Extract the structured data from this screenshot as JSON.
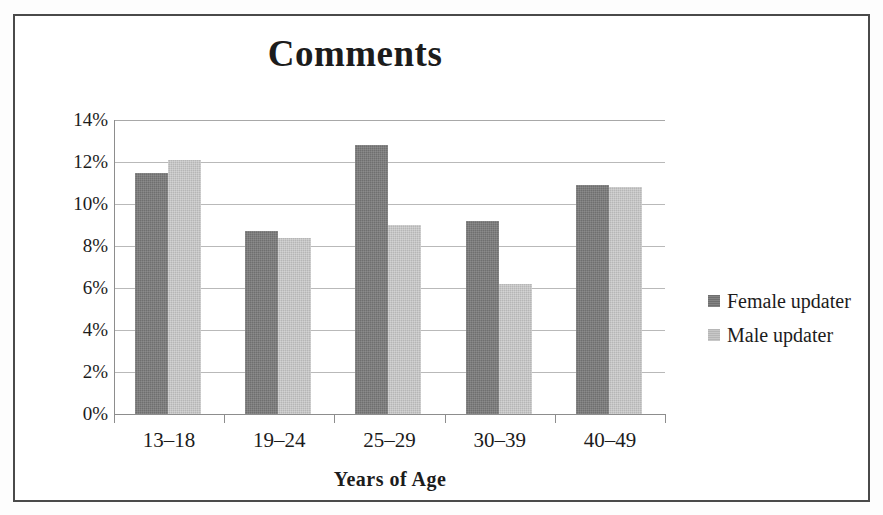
{
  "chart_data": {
    "type": "bar",
    "title": "Comments",
    "xlabel": "Years of Age",
    "ylabel": "",
    "categories": [
      "13–18",
      "19–24",
      "25–29",
      "30–39",
      "40–49"
    ],
    "series": [
      {
        "name": "Female updater",
        "color": "#6f6f6f",
        "values": [
          11.5,
          8.7,
          12.8,
          9.2,
          10.9
        ]
      },
      {
        "name": "Male updater",
        "color": "#b6b6b6",
        "values": [
          12.1,
          8.4,
          9.0,
          6.2,
          10.8
        ]
      }
    ],
    "ylim": [
      0,
      14
    ],
    "ytick_step": 2,
    "ytick_labels": [
      "14%",
      "12%",
      "10%",
      "8%",
      "6%",
      "4%",
      "2%",
      "0%"
    ],
    "ytick_values": [
      14,
      12,
      10,
      8,
      6,
      4,
      2,
      0
    ],
    "value_suffix": "%",
    "grid": true,
    "grid_axis": "y",
    "legend_position": "right",
    "orientation": "vertical",
    "bar_grouping": "clustered"
  },
  "figure": {
    "border_color": "#4a4a4a",
    "background": "#ffffff",
    "grid_color": "#b9b9b9",
    "axis_color": "#8d8d8d",
    "text_color": "#1c1c1c"
  }
}
